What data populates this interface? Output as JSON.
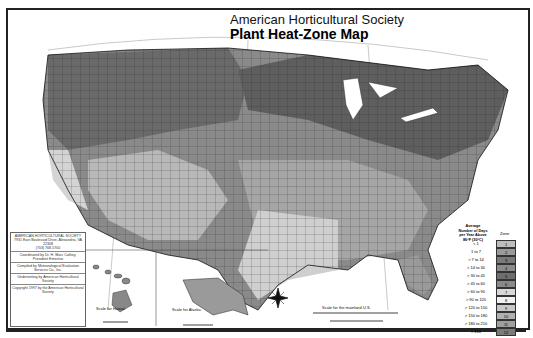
{
  "title": {
    "line1": "American Horticultural Society",
    "line2": "Plant Heat-Zone Map"
  },
  "infobox": {
    "org": "AMERICAN HORTICULTURAL SOCIETY",
    "address": "7931 East Boulevard Drive, Alexandria, VA 22308",
    "phone": "(703) 768-5700",
    "coordinated": "Coordinated by Dr. H. Marc Cathey, President Emeritus",
    "compiled": "Compiled by Meteorological Evaluation Services Co., Inc.",
    "underwriting": "Underwriting by American Horticultural Society",
    "copyright": "Copyright 1997 by the American Horticultural Society"
  },
  "insets": {
    "hawaii": {
      "labels": [
        "Oahu",
        "Kauai",
        "Molokai",
        "Lanai",
        "Maui",
        "Hawaii"
      ],
      "scale_label": "Scale for Hawaii"
    },
    "alaska": {
      "scale_label": "Scale for Alaska"
    }
  },
  "mainland_scale": {
    "label": "Scale for the mainland U.S.",
    "miles": [
      "0",
      "250",
      "500 Miles"
    ],
    "km": [
      "0",
      "250",
      "500 Kilometers"
    ]
  },
  "compass": {
    "n": "N",
    "s": "S",
    "e": "E",
    "w": "W"
  },
  "legend": {
    "header": "Average Number of Days per Year Above 86°F (30°C)",
    "zone_header": "Zone",
    "rows": [
      {
        "days": "< 1",
        "zone": "1",
        "color": "#bdbdbd"
      },
      {
        "days": "1 to 7",
        "zone": "2",
        "color": "#9a9a9a"
      },
      {
        "days": "> 7 to 14",
        "zone": "3",
        "color": "#7a7a7a"
      },
      {
        "days": "> 14 to 30",
        "zone": "4",
        "color": "#8c8c8c"
      },
      {
        "days": "> 30 to 45",
        "zone": "5",
        "color": "#6e6e6e"
      },
      {
        "days": "> 45 to 60",
        "zone": "6",
        "color": "#8a8a8a"
      },
      {
        "days": "> 60 to 90",
        "zone": "7",
        "color": "#d8d8d8"
      },
      {
        "days": "> 90 to 120",
        "zone": "8",
        "color": "#f0f0f0"
      },
      {
        "days": "> 120 to 150",
        "zone": "9",
        "color": "#c8c8c8"
      },
      {
        "days": "> 150 to 180",
        "zone": "10",
        "color": "#b0b0b0"
      },
      {
        "days": "> 180 to 210",
        "zone": "11",
        "color": "#a0a0a0"
      },
      {
        "days": "> 210",
        "zone": "12",
        "color": "#7c7c7c"
      }
    ]
  }
}
